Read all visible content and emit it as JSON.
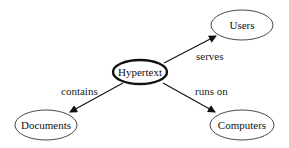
{
  "diagram": {
    "type": "concept-map",
    "nodes": [
      {
        "id": "hypertext",
        "label": "Hypertext",
        "emphasis": "bold-border"
      },
      {
        "id": "users",
        "label": "Users"
      },
      {
        "id": "documents",
        "label": "Documents"
      },
      {
        "id": "computers",
        "label": "Computers"
      }
    ],
    "edges": [
      {
        "from": "hypertext",
        "to": "users",
        "label": "serves"
      },
      {
        "from": "hypertext",
        "to": "documents",
        "label": "contains"
      },
      {
        "from": "hypertext",
        "to": "computers",
        "label": "runs on"
      }
    ],
    "colors": {
      "stroke": "#111111",
      "background": "#ffffff"
    }
  }
}
